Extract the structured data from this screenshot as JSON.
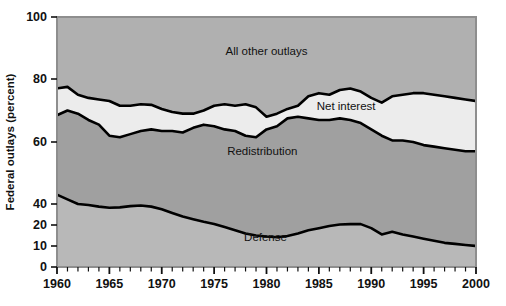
{
  "chart_data": {
    "type": "area",
    "title": "",
    "xlabel": "",
    "ylabel": "Federal outlays (percent)",
    "xlim": [
      1960,
      2000
    ],
    "ylim": [
      0,
      100
    ],
    "grid": false,
    "legend_position": "inline-band-labels",
    "xticks": [
      1960,
      1965,
      1970,
      1975,
      1980,
      1985,
      1990,
      1995,
      2000
    ],
    "xtick_labels": [
      "1960",
      "1965",
      "1970",
      "1975",
      "1980",
      "1985",
      "1990",
      "1995",
      "2000"
    ],
    "yticks": [
      0,
      10,
      20,
      40,
      60,
      80,
      100
    ],
    "ytick_labels": [
      "0",
      "10",
      "20",
      "40",
      "60",
      "80",
      "100"
    ],
    "y_axis_note": "broken/compressed scale between 20 and 40",
    "minor_xtick_interval": 1,
    "band_labels": [
      {
        "name": "all-other-outlays",
        "text": "All other outlays",
        "x": 1980.0,
        "y": 89.0
      },
      {
        "name": "net-interest",
        "text": "Net interest",
        "x": 1987.6,
        "y": 71.5
      },
      {
        "name": "redistribution",
        "text": "Redistribution",
        "x": 1979.6,
        "y": 57.0
      },
      {
        "name": "defense",
        "text": "Defense",
        "x": 1979.9,
        "y": 14.5
      }
    ],
    "colors": {
      "all_other_outlays_fill": "#b0b0b0",
      "net_interest_fill": "#ececec",
      "redistribution_fill": "#a0a0a0",
      "defense_fill": "#b8b8b8",
      "line": "#000000",
      "plot_border": "#8e8e8e",
      "text": "#111111",
      "background": "#ffffff"
    },
    "x": [
      1960,
      1961,
      1962,
      1963,
      1964,
      1965,
      1966,
      1967,
      1968,
      1969,
      1970,
      1971,
      1972,
      1973,
      1974,
      1975,
      1976,
      1977,
      1978,
      1979,
      1980,
      1981,
      1982,
      1983,
      1984,
      1985,
      1986,
      1987,
      1988,
      1989,
      1990,
      1991,
      1992,
      1993,
      1994,
      1995,
      1996,
      1997,
      1998,
      1999,
      2000
    ],
    "series": [
      {
        "name": "Net interest upper boundary (top of net interest band)",
        "description": "Cumulative total of Defense + Redistribution + Net interest as percent of federal outlays",
        "values": [
          77.0,
          77.5,
          75.0,
          74.0,
          73.5,
          73.0,
          71.5,
          71.5,
          72.0,
          71.8,
          70.5,
          69.5,
          69.0,
          69.0,
          70.0,
          71.5,
          72.0,
          71.5,
          72.0,
          71.0,
          68.0,
          69.0,
          70.5,
          71.5,
          74.5,
          75.5,
          75.0,
          76.5,
          77.0,
          76.0,
          74.0,
          72.5,
          74.5,
          75.0,
          75.5,
          75.5,
          75.0,
          74.5,
          74.0,
          73.5,
          73.0
        ]
      },
      {
        "name": "Net interest lower boundary (top of redistribution band)",
        "description": "Cumulative total of Defense + Redistribution as percent of federal outlays",
        "values": [
          68.5,
          70.0,
          69.0,
          67.0,
          65.5,
          62.0,
          61.5,
          62.5,
          63.5,
          64.0,
          63.5,
          63.5,
          63.0,
          64.5,
          65.5,
          65.0,
          64.0,
          63.5,
          62.0,
          61.5,
          64.0,
          65.0,
          67.5,
          68.0,
          67.5,
          67.0,
          67.0,
          67.5,
          67.0,
          66.0,
          64.0,
          62.0,
          60.5,
          60.5,
          60.0,
          59.0,
          58.5,
          58.0,
          57.5,
          57.0,
          57.0
        ]
      },
      {
        "name": "Defense",
        "description": "Defense spending as percent of federal outlays (boundary between Defense and Redistribution)",
        "values": [
          43.0,
          41.5,
          40.0,
          39.0,
          37.5,
          36.5,
          36.8,
          38.0,
          38.5,
          37.5,
          35.0,
          31.5,
          28.0,
          25.5,
          23.0,
          21.0,
          19.0,
          17.5,
          16.0,
          15.0,
          14.5,
          14.2,
          14.8,
          16.0,
          17.5,
          18.5,
          19.5,
          20.5,
          20.8,
          20.8,
          18.5,
          15.5,
          16.8,
          15.5,
          14.5,
          13.5,
          12.5,
          11.5,
          11.0,
          10.5,
          10.0
        ]
      }
    ]
  },
  "accessibility": {
    "figure_name": "federal-outlays-composition-area-chart"
  }
}
